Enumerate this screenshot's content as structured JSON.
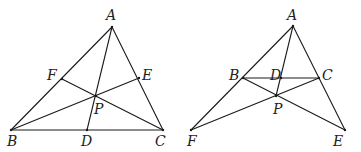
{
  "figures": [
    {
      "id": "left",
      "points": {
        "A": {
          "x": 112,
          "y": 27,
          "label": "A",
          "lx": 106,
          "ly": 20
        },
        "B": {
          "x": 11,
          "y": 130,
          "label": "B",
          "lx": 7,
          "ly": 146
        },
        "C": {
          "x": 163,
          "y": 130,
          "label": "C",
          "lx": 155,
          "ly": 146
        },
        "D": {
          "x": 87,
          "y": 130,
          "label": "D",
          "lx": 81,
          "ly": 146
        },
        "E": {
          "x": 139,
          "y": 78,
          "label": "E",
          "lx": 142,
          "ly": 80
        },
        "F": {
          "x": 62,
          "y": 79,
          "label": "F",
          "lx": 47,
          "ly": 80
        },
        "P": {
          "x": 96,
          "y": 96,
          "label": "P",
          "lx": 94,
          "ly": 114
        }
      },
      "segments": [
        [
          "A",
          "B"
        ],
        [
          "A",
          "C"
        ],
        [
          "B",
          "C"
        ],
        [
          "A",
          "D"
        ],
        [
          "B",
          "E"
        ],
        [
          "C",
          "F"
        ]
      ]
    },
    {
      "id": "right",
      "points": {
        "A": {
          "x": 293,
          "y": 26,
          "label": "A",
          "lx": 287,
          "ly": 20
        },
        "B": {
          "x": 243,
          "y": 78,
          "label": "B",
          "lx": 229,
          "ly": 80
        },
        "C": {
          "x": 319,
          "y": 78,
          "label": "C",
          "lx": 322,
          "ly": 80
        },
        "D": {
          "x": 281,
          "y": 78,
          "label": "D",
          "lx": 270,
          "ly": 80
        },
        "E": {
          "x": 345,
          "y": 130,
          "label": "E",
          "lx": 333,
          "ly": 146
        },
        "F": {
          "x": 191,
          "y": 130,
          "label": "F",
          "lx": 187,
          "ly": 146
        },
        "P": {
          "x": 276,
          "y": 96,
          "label": "P",
          "lx": 273,
          "ly": 114
        }
      },
      "segments": [
        [
          "A",
          "F"
        ],
        [
          "A",
          "E"
        ],
        [
          "B",
          "C"
        ],
        [
          "A",
          "P"
        ],
        [
          "B",
          "E"
        ],
        [
          "C",
          "F"
        ]
      ]
    }
  ],
  "colors": {
    "stroke": "#1a1a1a",
    "label": "#222222",
    "background": "#ffffff"
  }
}
